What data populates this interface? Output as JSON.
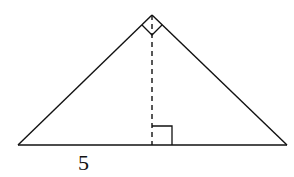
{
  "diagram": {
    "type": "right-triangle-with-altitude",
    "vertices": {
      "apex": [
        152,
        15
      ],
      "left": [
        18,
        145
      ],
      "right": [
        287,
        145
      ]
    },
    "altitude_foot": [
      152,
      145
    ],
    "right_angle_marks": [
      "apex",
      "altitude_foot"
    ],
    "labels": {
      "left_segment": "5"
    },
    "colors": {
      "stroke": "#111111",
      "background": "#ffffff"
    }
  }
}
